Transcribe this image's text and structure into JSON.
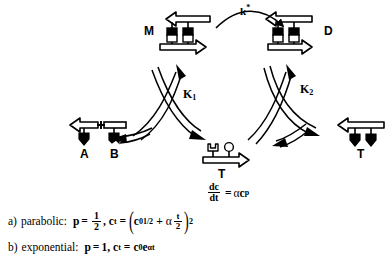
{
  "figure": {
    "type": "reaction-cycle-diagram",
    "caption_lines": [
      "a) parabolic:  p = 1/2, c_t = ( c_0^(1/2) + alpha t/2 )^2",
      "b) exponential:  p = 1, c_t = c_0 e^(alpha t)"
    ]
  },
  "species": {
    "monomer_template": {
      "id": "M",
      "label": "M",
      "role": "monomer template"
    },
    "duplex": {
      "id": "D",
      "label": "D",
      "role": "duplex / dimer"
    },
    "fragment_a": {
      "id": "A",
      "label": "A",
      "role": "fragment A"
    },
    "fragment_b": {
      "id": "B",
      "label": "B",
      "role": "fragment B"
    },
    "template_center": {
      "id": "T",
      "label": "T",
      "role": "free template"
    },
    "template_right": {
      "id": "T2",
      "label": "T",
      "role": "free template"
    }
  },
  "rate_constants": {
    "k_star": "k*",
    "k_star_base": "k",
    "k_star_sup": "*",
    "k1_base": "K",
    "k1_sub": "1",
    "k2_base": "K",
    "k2_sub": "2"
  },
  "rate_law": {
    "numerator": "dc",
    "denominator": "dt",
    "equals": "=",
    "rhs_alpha": "α",
    "rhs_c": "c",
    "rhs_exp": "p"
  },
  "equations": {
    "a": {
      "marker": "a)",
      "name": "parabolic:",
      "p_symbol": "p",
      "eq1": "=",
      "p_num": "1",
      "p_den": "2",
      "comma": ",",
      "c_symbol": "c",
      "c_sub": "t",
      "eq2": "=",
      "open_paren": "(",
      "c0_symbol": "c",
      "c0_sub": "0",
      "c0_sup": "1/2",
      "plus": "+",
      "alpha": "α",
      "t_num": "t",
      "t_den": "2",
      "close_paren": ")",
      "power": "2"
    },
    "b": {
      "marker": "b)",
      "name": "exponential:",
      "p_symbol": "p",
      "eq1": "=",
      "p_value": "1",
      "comma": ",",
      "c_symbol": "c",
      "c_sub": "t",
      "eq2": "=",
      "c0_symbol": "c",
      "c0_sub": "0",
      "e_symbol": "e",
      "e_sup": "αt"
    }
  },
  "colors": {
    "ink": "#000000",
    "paper": "#ffffff",
    "fill_hollow": "#ffffff"
  }
}
